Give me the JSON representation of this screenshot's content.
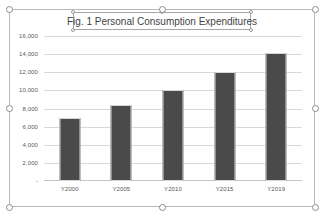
{
  "chart_object": {
    "selected": true,
    "selection_handles": [
      "top-left",
      "top-center",
      "top-right",
      "middle-left",
      "middle-right",
      "bottom-left",
      "bottom-center",
      "bottom-right"
    ],
    "title_box_handles": [
      "top-left",
      "top-center",
      "top-right",
      "bottom-left",
      "bottom-right"
    ]
  },
  "chart_data": {
    "type": "bar",
    "title": "Fig. 1 Personal Consumption Expenditures",
    "xlabel": "",
    "ylabel": "",
    "categories": [
      "Y2000",
      "Y2005",
      "Y2010",
      "Y2015",
      "Y2019"
    ],
    "values": [
      7000,
      8400,
      10000,
      12000,
      14100
    ],
    "ylim": [
      0,
      16000
    ],
    "yticks": [
      0,
      2000,
      4000,
      6000,
      8000,
      10000,
      12000,
      14000,
      16000
    ],
    "ytick_labels": [
      "-",
      "2,000",
      "4,000",
      "6,000",
      "8,000",
      "10,000",
      "12,000",
      "14,000",
      "16,000"
    ],
    "grid": true,
    "legend": false,
    "bar_color": "#4a4a4a",
    "gridline_color": "#d9d9d9",
    "axis_text_color": "#595959",
    "plot_background": "#ffffff"
  }
}
